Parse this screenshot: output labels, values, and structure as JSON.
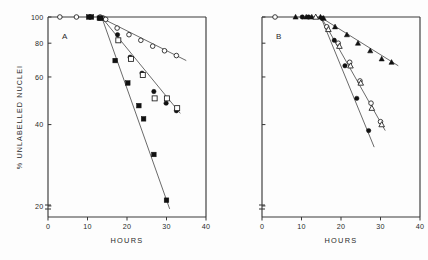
{
  "figure": {
    "yaxis_label": "% UNLABELLED NUCLEI",
    "xaxis_label": "HOURS"
  },
  "chart_data": [
    {
      "type": "scatter",
      "panel": "A",
      "title": "A",
      "xlabel": "HOURS",
      "ylabel": "% UNLABELLED NUCLEI",
      "xlim": [
        0,
        40
      ],
      "ylim": [
        18,
        100
      ],
      "yscale": "log",
      "xticks": [
        0,
        10,
        20,
        30,
        40
      ],
      "yticks": [
        20,
        40,
        60,
        80,
        100
      ],
      "grid": false,
      "legend": "none",
      "axis_break": true,
      "series": [
        {
          "name": "open-circle",
          "marker": "open-circle",
          "points": [
            {
              "x": 3.0,
              "y": 100
            },
            {
              "x": 7.2,
              "y": 100
            },
            {
              "x": 13.2,
              "y": 100
            },
            {
              "x": 14.0,
              "y": 99
            },
            {
              "x": 14.6,
              "y": 98
            },
            {
              "x": 17.5,
              "y": 91
            },
            {
              "x": 20.5,
              "y": 86
            },
            {
              "x": 23.5,
              "y": 82
            },
            {
              "x": 26.5,
              "y": 78
            },
            {
              "x": 29.5,
              "y": 75
            },
            {
              "x": 32.5,
              "y": 72
            }
          ],
          "fit_line": {
            "x1": 14.2,
            "y1": 98,
            "x2": 35.0,
            "y2": 69
          }
        },
        {
          "name": "filled-circle-open-square",
          "marker": "mixed-filled-circle-open-square",
          "points": [
            {
              "x": 10.3,
              "y": 100
            },
            {
              "x": 13.0,
              "y": 99
            },
            {
              "x": 17.6,
              "y": 86
            },
            {
              "x": 17.8,
              "y": 82
            },
            {
              "x": 20.8,
              "y": 71
            },
            {
              "x": 21.0,
              "y": 70
            },
            {
              "x": 23.8,
              "y": 62
            },
            {
              "x": 24.0,
              "y": 61
            },
            {
              "x": 26.8,
              "y": 53
            },
            {
              "x": 27.0,
              "y": 50
            },
            {
              "x": 29.9,
              "y": 48
            },
            {
              "x": 30.1,
              "y": 50
            },
            {
              "x": 32.5,
              "y": 45
            },
            {
              "x": 32.7,
              "y": 46
            }
          ],
          "fit_line": {
            "x1": 14.0,
            "y1": 98,
            "x2": 33.5,
            "y2": 44
          }
        },
        {
          "name": "filled-square",
          "marker": "filled-square",
          "points": [
            {
              "x": 11.0,
              "y": 100
            },
            {
              "x": 13.4,
              "y": 99
            },
            {
              "x": 17.0,
              "y": 69
            },
            {
              "x": 20.2,
              "y": 57
            },
            {
              "x": 23.0,
              "y": 47
            },
            {
              "x": 24.2,
              "y": 42
            },
            {
              "x": 26.8,
              "y": 31
            },
            {
              "x": 30.0,
              "y": 21
            }
          ],
          "fit_line": {
            "x1": 13.8,
            "y1": 98,
            "x2": 30.8,
            "y2": 19.5
          }
        }
      ]
    },
    {
      "type": "scatter",
      "panel": "B",
      "title": "B",
      "xlabel": "HOURS",
      "ylabel": "% UNLABELLED NUCLEI",
      "xlim": [
        0,
        40
      ],
      "ylim": [
        18,
        100
      ],
      "yscale": "log",
      "xticks": [
        0,
        10,
        20,
        30,
        40
      ],
      "yticks": [
        20,
        40,
        60,
        80,
        100
      ],
      "grid": false,
      "legend": "none",
      "axis_break": true,
      "series": [
        {
          "name": "filled-triangle",
          "marker": "filled-triangle",
          "points": [
            {
              "x": 8.5,
              "y": 100
            },
            {
              "x": 11.2,
              "y": 100
            },
            {
              "x": 12.6,
              "y": 100
            },
            {
              "x": 14.8,
              "y": 100
            },
            {
              "x": 15.6,
              "y": 99
            },
            {
              "x": 18.5,
              "y": 92
            },
            {
              "x": 21.5,
              "y": 86
            },
            {
              "x": 24.3,
              "y": 80
            },
            {
              "x": 27.4,
              "y": 75
            },
            {
              "x": 30.3,
              "y": 70
            },
            {
              "x": 32.8,
              "y": 68
            }
          ],
          "fit_line": {
            "x1": 15.2,
            "y1": 99,
            "x2": 34.5,
            "y2": 66
          }
        },
        {
          "name": "open-circle-open-triangle",
          "marker": "mixed-open-circle-open-triangle",
          "points": [
            {
              "x": 3.3,
              "y": 100
            },
            {
              "x": 13.6,
              "y": 100
            },
            {
              "x": 16.4,
              "y": 92
            },
            {
              "x": 16.8,
              "y": 90
            },
            {
              "x": 19.3,
              "y": 80
            },
            {
              "x": 19.6,
              "y": 78
            },
            {
              "x": 22.2,
              "y": 68
            },
            {
              "x": 22.4,
              "y": 66
            },
            {
              "x": 24.8,
              "y": 58
            },
            {
              "x": 25.0,
              "y": 57
            },
            {
              "x": 27.6,
              "y": 48
            },
            {
              "x": 27.8,
              "y": 46
            },
            {
              "x": 30.0,
              "y": 41
            },
            {
              "x": 30.3,
              "y": 40
            }
          ],
          "fit_line": {
            "x1": 15.3,
            "y1": 98,
            "x2": 31.2,
            "y2": 38
          }
        },
        {
          "name": "filled-circle",
          "marker": "filled-circle",
          "points": [
            {
              "x": 10.2,
              "y": 100
            },
            {
              "x": 11.8,
              "y": 100
            },
            {
              "x": 15.2,
              "y": 99
            },
            {
              "x": 18.3,
              "y": 82
            },
            {
              "x": 21.0,
              "y": 66
            },
            {
              "x": 24.0,
              "y": 50
            },
            {
              "x": 27.0,
              "y": 38
            }
          ],
          "fit_line": {
            "x1": 15.0,
            "y1": 99,
            "x2": 28.4,
            "y2": 33
          }
        }
      ]
    }
  ]
}
